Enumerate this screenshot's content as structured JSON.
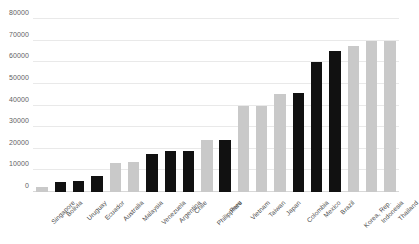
{
  "chart_data": {
    "type": "bar",
    "title": "",
    "subtitle": "",
    "xlabel": "",
    "ylabel": "",
    "ylim": [
      0,
      80000
    ],
    "ytick_labels": [
      "0",
      "10000",
      "20000",
      "30000",
      "40000",
      "50000",
      "60000",
      "70000",
      "80000"
    ],
    "ytick_values": [
      0,
      10000,
      20000,
      30000,
      40000,
      50000,
      60000,
      70000,
      80000
    ],
    "grid": true,
    "legend": "none",
    "categories": [
      "Singapore",
      "Bolivia",
      "Uruguay",
      "Ecuador",
      "Australia",
      "Malaysia",
      "Venezuela",
      "Argentina",
      "Chile",
      "Philippines",
      "Peru",
      "Vietnam",
      "Taiwan",
      "Japan",
      "Colombia",
      "Mexico",
      "Brazil",
      "Korea, Rep.",
      "Indonesia",
      "Thailand"
    ],
    "values": [
      2500,
      4800,
      5200,
      7500,
      13500,
      13700,
      17500,
      19000,
      19000,
      24000,
      24000,
      40000,
      40000,
      45500,
      46000,
      60000,
      65000,
      67500,
      70000,
      70000
    ],
    "bar_colors": [
      "#c9c9c9",
      "#111111",
      "#111111",
      "#111111",
      "#c9c9c9",
      "#c9c9c9",
      "#111111",
      "#111111",
      "#111111",
      "#c9c9c9",
      "#111111",
      "#c9c9c9",
      "#c9c9c9",
      "#c9c9c9",
      "#111111",
      "#111111",
      "#111111",
      "#c9c9c9",
      "#c9c9c9",
      "#c9c9c9"
    ],
    "colors": {
      "dark": "#111111",
      "light": "#c9c9c9",
      "gridline": "#e9e9e9",
      "axis_text": "#5f5f5f",
      "background": "#ffffff"
    }
  }
}
